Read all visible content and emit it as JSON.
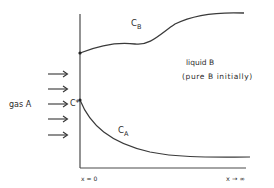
{
  "diagram": {
    "colors": {
      "line": "#3a3a3a",
      "text": "#2a2a2a",
      "background": "#ffffff"
    },
    "labels": {
      "gas": "gas A",
      "interface_conc": "C*",
      "cb_main": "C",
      "cb_sub": "B",
      "ca_main": "C",
      "ca_sub": "A",
      "liquid_line1": "liquid B",
      "liquid_line2": "(pure B initially)",
      "x_zero": "x = 0",
      "x_inf": "x → ∞"
    },
    "arrows": [
      {
        "y": 74
      },
      {
        "y": 89
      },
      {
        "y": 104
      },
      {
        "y": 119
      },
      {
        "y": 135
      }
    ],
    "curves": {
      "cb": "M80,53 C100,45 120,42 135,44 C150,46 160,34 175,24 C195,14 220,12 244,13",
      "ca": "M80,100 C90,125 110,143 150,152 C180,158 210,157 250,157"
    }
  }
}
